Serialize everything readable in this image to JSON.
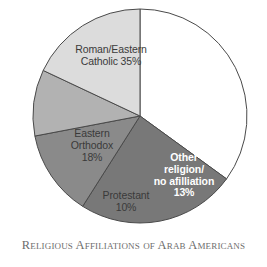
{
  "caption": "Religious Affiliations of Arab Americans",
  "chart_data": {
    "type": "pie",
    "title": "Religious Affiliations of Arab Americans",
    "xlabel": "",
    "ylabel": "",
    "legend": "none",
    "grid": false,
    "start_angle_deg": 0,
    "direction": "clockwise",
    "categories": [
      "Roman/Eastern Catholic",
      "Muslim",
      "Other religion/no afilliation",
      "Protestant",
      "Eastern Orthodox"
    ],
    "values": [
      35,
      24,
      13,
      10,
      18
    ],
    "units": "percent",
    "colors": [
      "#ffffff",
      "#787878",
      "#8a8a8a",
      "#b2b2b2",
      "#dcdcdc"
    ],
    "slices": [
      {
        "name": "Roman/Eastern Catholic",
        "value": 35,
        "label_line1": "Roman/Eastern",
        "label_line2": "Catholic 35%",
        "percent_text": "35%",
        "color": "#ffffff",
        "text_color": "#3a3a3a"
      },
      {
        "name": "Muslim",
        "value": 24,
        "label_line1": "Muslim",
        "label_line2": "24%",
        "percent_text": "24%",
        "color": "#787878",
        "text_color": "#ffffff"
      },
      {
        "name": "Other religion/no afilliation",
        "value": 13,
        "label_line1": "Other",
        "label_line2": "religion/",
        "label_line3": "no afilliation",
        "label_line4": "13%",
        "percent_text": "13%",
        "color": "#8a8a8a",
        "text_color": "#ffffff"
      },
      {
        "name": "Protestant",
        "value": 10,
        "label_line1": "Protestant",
        "label_line2": "10%",
        "percent_text": "10%",
        "color": "#b2b2b2",
        "text_color": "#3a3a3a"
      },
      {
        "name": "Eastern Orthodox",
        "value": 18,
        "label_line1": "Eastern",
        "label_line2": "Orthodox",
        "label_line3": "18%",
        "percent_text": "18%",
        "color": "#dcdcdc",
        "text_color": "#3a3a3a"
      }
    ]
  },
  "labels": {
    "catholic": "Roman/Eastern\nCatholic 35%",
    "muslim": "Muslim\n24%",
    "other": "Other\nreligion/\nno afilliation\n13%",
    "protestant": "Protestant\n10%",
    "orthodox": "Eastern\nOrthodox\n18%"
  },
  "geometry": {
    "center_x": 140,
    "center_y": 116,
    "radius": 107,
    "outline_color": "#4a4a4a"
  }
}
